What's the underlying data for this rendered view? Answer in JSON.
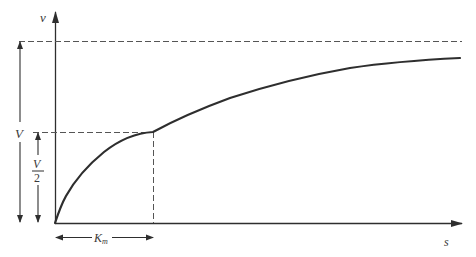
{
  "diagram": {
    "type": "michaelis-menten saturation curve",
    "axes": {
      "y_label": "v",
      "x_label": "s"
    },
    "annotations": {
      "max_label": "V",
      "half_max_numerator": "V",
      "half_max_denominator": "2",
      "km_label": "K",
      "km_subscript": "m"
    },
    "colors": {
      "line": "#2e2e2e",
      "dashed": "#555555",
      "background": "#ffffff"
    }
  }
}
